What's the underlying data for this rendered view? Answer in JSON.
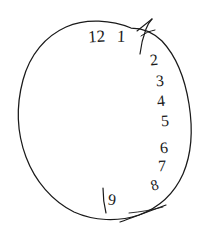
{
  "drawing": {
    "title": "Clock drawing",
    "background_color": "#ffffff",
    "ink_color": "#1a1a1a",
    "medium": "pen-sketch",
    "canvas": {
      "width": 208,
      "height": 235
    }
  },
  "clock_face": {
    "shape_name": "hand-drawn-circle",
    "description": "Irregular freehand oval clock rim",
    "center": {
      "x": 104,
      "y": 118
    },
    "radius_x": 84,
    "radius_y": 100
  },
  "numerals": [
    {
      "id": "numeral-12",
      "label": "12",
      "x": 88,
      "y": 28,
      "size": 17,
      "rotate": -4
    },
    {
      "id": "numeral-1",
      "label": "1",
      "x": 117,
      "y": 28,
      "size": 17,
      "rotate": 2
    },
    {
      "id": "numeral-2",
      "label": "2",
      "x": 150,
      "y": 52,
      "size": 16,
      "rotate": -6
    },
    {
      "id": "numeral-3",
      "label": "3",
      "x": 156,
      "y": 73,
      "size": 16,
      "rotate": -4
    },
    {
      "id": "numeral-4",
      "label": "4",
      "x": 157,
      "y": 93,
      "size": 16,
      "rotate": -6
    },
    {
      "id": "numeral-5",
      "label": "5",
      "x": 161,
      "y": 113,
      "size": 16,
      "rotate": -3
    },
    {
      "id": "numeral-6",
      "label": "6",
      "x": 160,
      "y": 140,
      "size": 16,
      "rotate": -6
    },
    {
      "id": "numeral-7",
      "label": "7",
      "x": 158,
      "y": 158,
      "size": 16,
      "rotate": -2
    },
    {
      "id": "numeral-8",
      "label": "8",
      "x": 151,
      "y": 178,
      "size": 15,
      "rotate": -18
    },
    {
      "id": "numeral-9",
      "label": "9",
      "x": 108,
      "y": 192,
      "size": 16,
      "rotate": 6
    }
  ],
  "stray_marks": [
    {
      "id": "stray-stroke-near-9",
      "description": "Tall vertical pen stroke drawn just left of the 9"
    }
  ],
  "hands": [
    {
      "id": "hand-upper-right",
      "description": "Arrow-like stroke at the one-o'clock position breaching the rim",
      "name": "clock-hand-upper"
    },
    {
      "id": "hand-lower-right",
      "description": "Straight stroke crossing the rim at the lower-right, pointing outward",
      "name": "clock-hand-lower"
    }
  ]
}
